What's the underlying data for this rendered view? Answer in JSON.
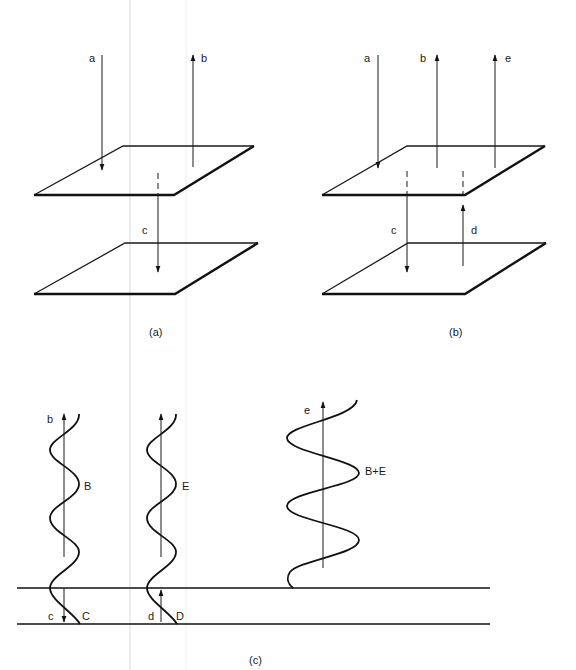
{
  "figure": {
    "panels": [
      {
        "id": "a",
        "caption": "(a)",
        "arrows": [
          {
            "label": "a",
            "direction": "down"
          },
          {
            "label": "b",
            "direction": "up"
          },
          {
            "label": "c",
            "direction": "down"
          }
        ],
        "planes": 2
      },
      {
        "id": "b",
        "caption": "(b)",
        "arrows": [
          {
            "label": "a",
            "direction": "down"
          },
          {
            "label": "b",
            "direction": "up"
          },
          {
            "label": "e",
            "direction": "up"
          },
          {
            "label": "c",
            "direction": "down"
          },
          {
            "label": "d",
            "direction": "up"
          }
        ],
        "planes": 2
      },
      {
        "id": "c",
        "caption": "(c)",
        "waves": [
          {
            "label": "B",
            "arrow": "b",
            "lower_label": "C",
            "lower_arrow": "c"
          },
          {
            "label": "E",
            "arrow": "",
            "lower_label": "D",
            "lower_arrow": "d"
          },
          {
            "label": "B+E",
            "arrow": "e"
          }
        ]
      }
    ]
  }
}
